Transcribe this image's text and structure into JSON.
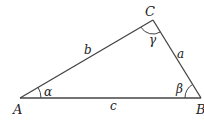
{
  "diagram": {
    "stroke_color": "#444444",
    "vertices": [
      {
        "id": "A",
        "label": "A",
        "x": 20,
        "y": 98
      },
      {
        "id": "B",
        "label": "B",
        "x": 201,
        "y": 98
      },
      {
        "id": "C",
        "label": "C",
        "x": 153,
        "y": 20
      }
    ],
    "sides": [
      {
        "id": "a",
        "label": "a",
        "from": "B",
        "to": "C"
      },
      {
        "id": "b",
        "label": "b",
        "from": "A",
        "to": "C"
      },
      {
        "id": "c",
        "label": "c",
        "from": "A",
        "to": "B"
      }
    ],
    "angles": [
      {
        "id": "alpha",
        "label": "α",
        "vertex": "A"
      },
      {
        "id": "beta",
        "label": "β",
        "vertex": "B"
      },
      {
        "id": "gamma",
        "label": "γ",
        "vertex": "C"
      }
    ]
  }
}
